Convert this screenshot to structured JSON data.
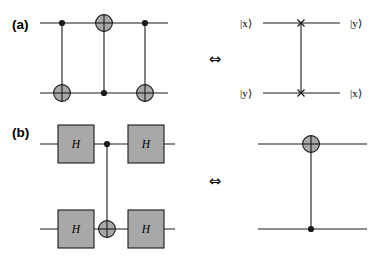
{
  "figure": {
    "background_color": "#ffffff",
    "ink_color": "#1a1a1a",
    "gate_fill_color": "#a8a8a8",
    "gate_stroke_color": "#1a1a1a",
    "equivalence_symbol": "⇔",
    "panels": [
      {
        "id": "a",
        "label": "(a)",
        "left_circuit": {
          "name": "three-cnot-swap",
          "gates": [
            "control-dot",
            "target-circle",
            "control-dot"
          ]
        },
        "right_circuit": {
          "name": "swap-gate",
          "gates": [
            "swap-cross",
            "swap-cross"
          ]
        },
        "input_labels": [
          "|x⟩",
          "|y⟩"
        ],
        "output_labels": [
          "|y⟩",
          "|x⟩"
        ]
      },
      {
        "id": "b",
        "label": "(b)",
        "left_circuit": {
          "name": "hadamard-conjugated-cnot",
          "gate_letter": "H",
          "gates": [
            "H",
            "control-dot",
            "H",
            "H",
            "target-circle",
            "H"
          ]
        },
        "right_circuit": {
          "name": "reversed-cnot",
          "gates": [
            "target-circle",
            "control-dot"
          ]
        }
      }
    ],
    "gate_letters": {
      "hadamard": "H"
    }
  }
}
